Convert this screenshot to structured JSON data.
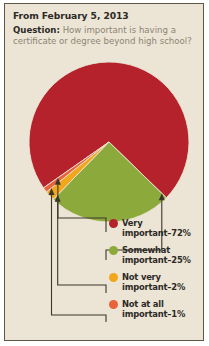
{
  "header": {
    "date_line": "From February 5, 2013",
    "question_label": "Question:",
    "question_text": "How important is having a certificate or degree beyond high school?"
  },
  "colors": {
    "background": "#ece5d5",
    "border": "#5d564a",
    "page": "#ffffff",
    "text_dark": "#2c2a26",
    "text_muted": "#8c8474",
    "leader_line": "#3b352c",
    "very_important": "#b5222b",
    "somewhat_important": "#8caa3c",
    "not_very_important": "#f2a71b",
    "not_at_all_important": "#e8623a"
  },
  "chart_data": {
    "type": "pie",
    "title": "How important is having a certificate or degree beyond high school?",
    "categories": [
      "Very important",
      "Somewhat important",
      "Not very important",
      "Not at all important"
    ],
    "values": [
      72,
      25,
      2,
      1
    ],
    "unit": "%",
    "legend_position": "right",
    "start_angle_deg": 145,
    "direction": "clockwise",
    "slices": [
      {
        "label": "Very important",
        "value": 72,
        "color": "#b5222b",
        "legend_text": "Very important–72%"
      },
      {
        "label": "Somewhat important",
        "value": 25,
        "color": "#8caa3c",
        "legend_text": "Somewhat important–25%"
      },
      {
        "label": "Not very important",
        "value": 2,
        "color": "#f2a71b",
        "legend_text": "Not very important–2%"
      },
      {
        "label": "Not at all important",
        "value": 1,
        "color": "#e8623a",
        "legend_text": "Not at all important–1%"
      }
    ]
  },
  "legend": {
    "items": [
      {
        "line1": "Very",
        "line2": "important–72%"
      },
      {
        "line1": "Somewhat",
        "line2": "important–25%"
      },
      {
        "line1": "Not very",
        "line2": "important–2%"
      },
      {
        "line1": "Not at all",
        "line2": "important–1%"
      }
    ]
  }
}
